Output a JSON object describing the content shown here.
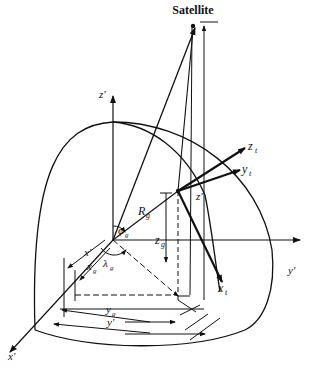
{
  "figure": {
    "satellite_label": "Satellite",
    "axes": {
      "z_prime": "z'",
      "y_prime": "y'",
      "x_prime": "x'"
    },
    "topocentric_axes": {
      "z_t": "z",
      "z_t_sub": "t",
      "y_t": "y",
      "y_t_sub": "t",
      "x_t": "x",
      "x_t_sub": "t"
    },
    "labels": {
      "R_g": "R",
      "R_g_sub": "g",
      "z_g": "z",
      "z_g_sub": "g",
      "phi_g": "φ",
      "phi_g_sub": "g",
      "lambda_g": "λ",
      "lambda_g_sub": "g",
      "x_g": "x",
      "x_g_sub": "g",
      "x_prime_dim": "x'",
      "y_g": "y",
      "y_g_sub": "g",
      "y_prime_dim": "y'",
      "z_prime_dim": "z'"
    },
    "colors": {
      "ink": "#111111",
      "background": "#ffffff"
    }
  }
}
